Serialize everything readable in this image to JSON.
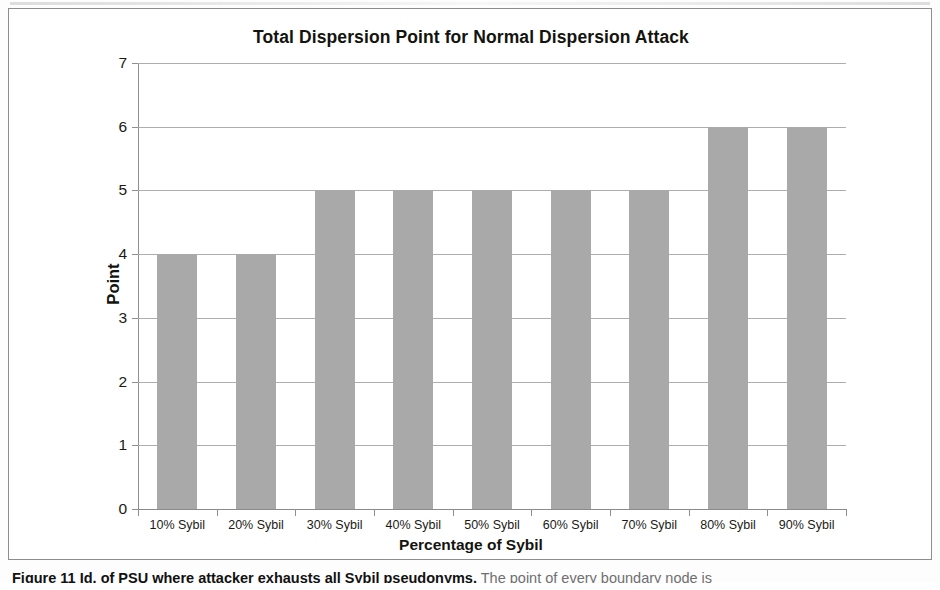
{
  "figure": {
    "caption_strong": "Figure 11 Id. of PSU where attacker exhausts all Sybil pseudonyms.",
    "caption_rest": " The point of every boundary node is",
    "frame_color": "#8d8d8d"
  },
  "chart_data": {
    "type": "bar",
    "title": "Total Dispersion Point for Normal Dispersion Attack",
    "xlabel": "Percentage of Sybil",
    "ylabel": "Point",
    "categories": [
      "10% Sybil",
      "20% Sybil",
      "30% Sybil",
      "40% Sybil",
      "50% Sybil",
      "60% Sybil",
      "70% Sybil",
      "80% Sybil",
      "90% Sybil"
    ],
    "values": [
      4,
      4,
      5,
      5,
      5,
      5,
      5,
      6,
      6
    ],
    "ylim": [
      0,
      7
    ],
    "ytick_step": 1,
    "yticks": [
      "7",
      "6",
      "5",
      "4",
      "3",
      "2",
      "1",
      "0"
    ],
    "grid": true,
    "legend": false,
    "legend_position": "none",
    "bar_color": "#a9a9a9",
    "gridline_color": "#adadad",
    "axis_color": "#8f8f8f",
    "text_color": "#14140f"
  }
}
